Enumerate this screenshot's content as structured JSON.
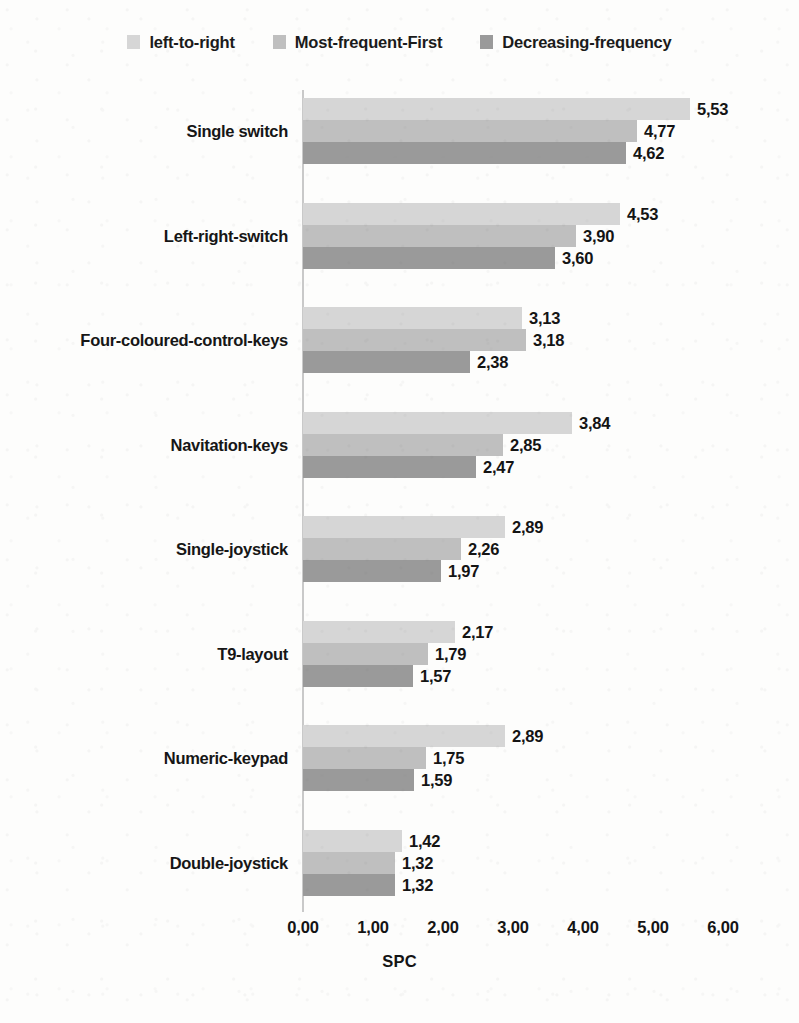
{
  "chart_data": {
    "type": "bar",
    "orientation": "horizontal",
    "title": "",
    "xlabel": "SPC",
    "ylabel": "",
    "xlim": [
      0,
      6
    ],
    "xticks": [
      "0,00",
      "1,00",
      "2,00",
      "3,00",
      "4,00",
      "5,00",
      "6,00"
    ],
    "xtick_values": [
      0,
      1,
      2,
      3,
      4,
      5,
      6
    ],
    "grid": false,
    "legend_position": "top-center",
    "decimal_separator": ",",
    "categories": [
      "Single switch",
      "Left-right-switch",
      "Four-coloured-control-keys",
      "Navitation-keys",
      "Single-joystick",
      "T9-layout",
      "Numeric-keypad",
      "Double-joystick"
    ],
    "series": [
      {
        "name": "left-to-right",
        "color": "#d6d6d6",
        "values": [
          5.53,
          4.53,
          3.13,
          3.84,
          2.89,
          2.17,
          2.89,
          1.42
        ],
        "labels": [
          "5,53",
          "4,53",
          "3,13",
          "3,84",
          "2,89",
          "2,17",
          "2,89",
          "1,42"
        ],
        "bar_px_lengths": [
          404,
          331,
          304,
          280,
          267,
          155,
          268,
          106
        ]
      },
      {
        "name": "Most-frequent-First",
        "color": "#bfbfbf",
        "values": [
          4.77,
          3.9,
          3.18,
          2.85,
          2.26,
          1.79,
          1.75,
          1.32
        ],
        "labels": [
          "4,77",
          "3,90",
          "3,18",
          "2,85",
          "2,26",
          "1,79",
          "1,75",
          "1,32"
        ],
        "bar_px_lengths": [
          347,
          285,
          310,
          208,
          165,
          131,
          128,
          96
        ]
      },
      {
        "name": "Decreasing-frequency",
        "color": "#9a9a9a",
        "values": [
          4.62,
          3.6,
          2.38,
          2.47,
          1.97,
          1.57,
          1.59,
          1.32
        ],
        "labels": [
          "4,62",
          "3,60",
          "2,38",
          "2,47",
          "1,97",
          "1,57",
          "1,59",
          "1,32"
        ],
        "bar_px_lengths": [
          337,
          263,
          228,
          180,
          144,
          115,
          116,
          96
        ]
      }
    ]
  },
  "legend": {
    "entries": [
      {
        "label": "left-to-right",
        "color": "#d6d6d6"
      },
      {
        "label": "Most-frequent-First",
        "color": "#bfbfbf"
      },
      {
        "label": "Decreasing-frequency",
        "color": "#9a9a9a"
      }
    ]
  },
  "axis": {
    "x_title": "SPC"
  }
}
